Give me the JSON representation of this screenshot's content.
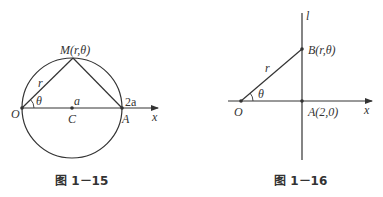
{
  "figures": [
    {
      "caption": "图 1－15",
      "labels": {
        "M": "M(r,θ)",
        "r": "r",
        "theta": "θ",
        "O": "O",
        "C": "C",
        "a": "a",
        "two_a": "2a",
        "A": "A",
        "x": "x"
      }
    },
    {
      "caption": "图 1－16",
      "labels": {
        "l": "l",
        "B": "B(r,θ)",
        "r": "r",
        "theta": "θ",
        "O": "O",
        "A": "A(2,0)",
        "x": "x"
      }
    }
  ]
}
